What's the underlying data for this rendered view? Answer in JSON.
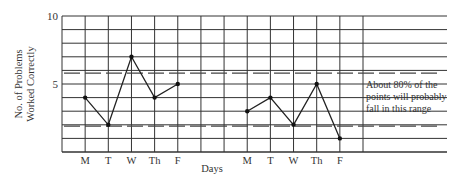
{
  "chart_data": {
    "type": "line",
    "title": "",
    "xlabel": "Days",
    "ylabel": "No. of Problems Worked Correctly",
    "ylabel_lines": [
      "No. of Problems",
      "Worked Correctly"
    ],
    "ylim": [
      0,
      10
    ],
    "y_tick_labels": [
      "5",
      "10"
    ],
    "y_ticks": [
      5,
      10
    ],
    "grid": true,
    "categories": [
      "M",
      "T",
      "W",
      "Th",
      "F",
      "",
      "",
      "M",
      "T",
      "W",
      "Th",
      "F"
    ],
    "series": [
      {
        "name": "Week 1",
        "x": [
          "M",
          "T",
          "W",
          "Th",
          "F"
        ],
        "values": [
          4,
          2,
          7,
          4,
          5
        ]
      },
      {
        "name": "Week 2",
        "x": [
          "M",
          "T",
          "W",
          "Th",
          "F"
        ],
        "values": [
          3,
          4,
          2,
          5,
          1
        ]
      }
    ],
    "reference_lines": [
      {
        "style": "dashed",
        "y": 5.8,
        "label": "upper limit"
      },
      {
        "style": "dashed",
        "y": 1.9,
        "label": "lower limit"
      }
    ],
    "annotation": {
      "lines": [
        "About 80% of the",
        "points will probably",
        "fall in this range"
      ]
    },
    "legend": "none"
  },
  "labels": {
    "y_label_line1": "No. of Problems",
    "y_label_line2": "Worked Correctly",
    "x_label": "Days",
    "y_tick_5": "5",
    "y_tick_10": "10",
    "week1_days": [
      "M",
      "T",
      "W",
      "Th",
      "F"
    ],
    "week2_days": [
      "M",
      "T",
      "W",
      "Th",
      "F"
    ],
    "annotation_line1": "About 80% of the",
    "annotation_line2": "points will probably",
    "annotation_line3": "fall in this range"
  }
}
